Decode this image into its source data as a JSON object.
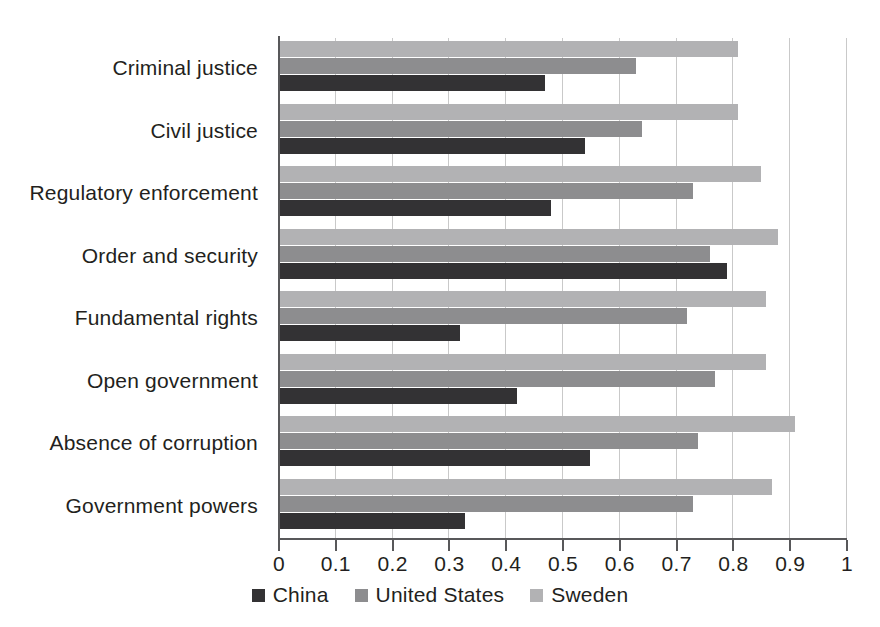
{
  "chart_data": {
    "type": "bar",
    "orientation": "horizontal",
    "title": "",
    "subtitle": "",
    "xlabel": "",
    "ylabel": "",
    "xlim": [
      0,
      1
    ],
    "xticks": [
      "0",
      "0.1",
      "0.2",
      "0.3",
      "0.4",
      "0.5",
      "0.6",
      "0.7",
      "0.8",
      "0.9",
      "1"
    ],
    "xtick_values": [
      0,
      0.1,
      0.2,
      0.3,
      0.4,
      0.5,
      0.6,
      0.7,
      0.8,
      0.9,
      1
    ],
    "grid": "vertical",
    "legend_position": "bottom-center",
    "categories": [
      "Criminal justice",
      "Civil justice",
      "Regulatory enforcement",
      "Order and security",
      "Fundamental rights",
      "Open government",
      "Absence of corruption",
      "Government powers"
    ],
    "series": [
      {
        "name": "China",
        "color": "#333234",
        "values": [
          0.47,
          0.54,
          0.48,
          0.79,
          0.32,
          0.42,
          0.55,
          0.33
        ]
      },
      {
        "name": "United States",
        "color": "#8d8d8f",
        "values": [
          0.63,
          0.64,
          0.73,
          0.76,
          0.72,
          0.77,
          0.74,
          0.73
        ]
      },
      {
        "name": "Sweden",
        "color": "#b2b2b4",
        "values": [
          0.81,
          0.81,
          0.85,
          0.88,
          0.86,
          0.86,
          0.91,
          0.87
        ]
      }
    ]
  },
  "legend": {
    "items": [
      {
        "label": "China",
        "color": "#333234"
      },
      {
        "label": "United States",
        "color": "#8d8d8f"
      },
      {
        "label": "Sweden",
        "color": "#b2b2b4"
      }
    ]
  },
  "colors": {
    "china": "#333234",
    "united_states": "#8d8d8f",
    "sweden": "#b2b2b4",
    "axis": "#58585a",
    "gridline": "#c9c9c9",
    "text": "#231f20",
    "background": "#ffffff"
  }
}
